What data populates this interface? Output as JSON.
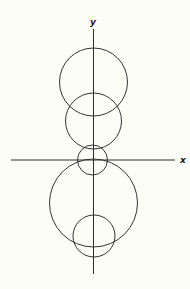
{
  "figure": {
    "background": "#fdfdf8",
    "line_color": "#333333",
    "axes": {
      "x_label": "x",
      "y_label": "y",
      "origin": [
        93.5,
        160
      ],
      "x_axis": {
        "x1": 11,
        "x2": 175,
        "y": 160
      },
      "y_axis": {
        "x": 93.5,
        "y1": 29,
        "y2": 274
      },
      "x_label_pos": [
        180,
        163
      ],
      "y_label_pos": [
        90,
        25
      ]
    },
    "circles": [
      {
        "name": "upper-large-circle",
        "cx": 93.5,
        "cy": 82,
        "r": 34
      },
      {
        "name": "upper-middle-circle",
        "cx": 93.5,
        "cy": 121,
        "r": 28
      },
      {
        "name": "origin-small-circle",
        "cx": 92.5,
        "cy": 160,
        "r": 15
      },
      {
        "name": "lower-large-circle",
        "cx": 93.5,
        "cy": 203,
        "r": 44
      },
      {
        "name": "lower-small-circle",
        "cx": 94,
        "cy": 236,
        "r": 21
      }
    ]
  }
}
